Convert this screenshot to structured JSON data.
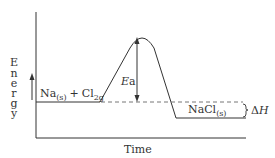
{
  "diagram": {
    "type": "energy-profile",
    "y_axis_label": "Energy",
    "y_axis_letters": [
      "E",
      "n",
      "e",
      "r",
      "g",
      "y"
    ],
    "x_axis_label": "Time",
    "reactants": {
      "main": "Na",
      "sub1": "(s)",
      "plus": "+",
      "main2": "Cl",
      "sub2": "2g"
    },
    "products": {
      "main": "NaCl",
      "sub": "(s)"
    },
    "activation_energy_label": {
      "italic": "E",
      "rest": "a"
    },
    "enthalpy_label": {
      "delta": "Δ",
      "italic": "H"
    },
    "colors": {
      "line": "#333333",
      "dashed": "#777777",
      "background": "#ffffff"
    }
  }
}
